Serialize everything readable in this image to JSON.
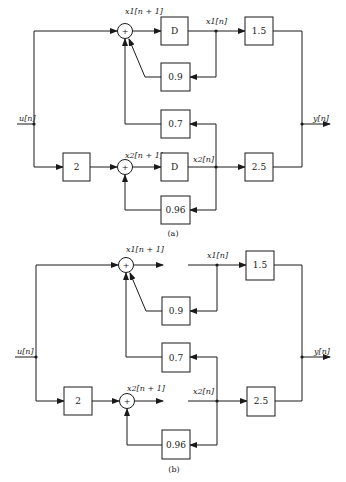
{
  "figure": {
    "background": "#ffffff",
    "ink": "#1a1a1a"
  },
  "diagrams": [
    {
      "id": "a",
      "caption": "(a)",
      "input_label": "u[n]",
      "output_label": "y[n]",
      "state1_next_label": "x1[n + 1]",
      "state1_label": "x1[n]",
      "state2_next_label": "x2[n + 1]",
      "state2_label": "x2[n]",
      "delay1": "D",
      "delay2": "D",
      "gain_input2": "2",
      "gain_fb11": "0.9",
      "gain_fb21": "0.7",
      "gain_fb22": "0.96",
      "gain_out1": "1.5",
      "gain_out2": "2.5",
      "sum_symbol": "+"
    },
    {
      "id": "b",
      "caption": "(b)",
      "input_label": "u[n]",
      "output_label": "y[n]",
      "state1_next_label": "x1[n + 1]",
      "state1_label": "x1[n]",
      "state2_next_label": "x2[n + 1]",
      "state2_label": "x2[n]",
      "delay1": "",
      "delay2": "",
      "gain_input2": "2",
      "gain_fb11": "0.9",
      "gain_fb21": "0.7",
      "gain_fb22": "0.96",
      "gain_out1": "1.5",
      "gain_out2": "2.5",
      "sum_symbol": "+"
    }
  ]
}
